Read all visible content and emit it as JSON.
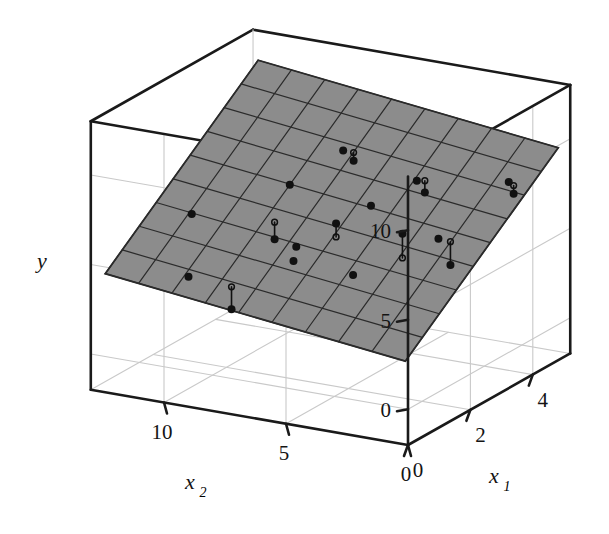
{
  "figure": {
    "kind": "3d-scatter-with-regression-plane",
    "background": "#ffffff",
    "width": 609,
    "height": 534
  },
  "axes": {
    "y": {
      "title": "y",
      "ticks": [
        "0",
        "5",
        "10"
      ],
      "tick_values": [
        0,
        5,
        10
      ],
      "range": [
        -2,
        13
      ]
    },
    "x1": {
      "title": "x",
      "subscript": "1",
      "ticks": [
        "0",
        "2",
        "4"
      ],
      "tick_values": [
        0,
        2,
        4
      ],
      "range": [
        0,
        5.2
      ]
    },
    "x2": {
      "title": "x",
      "subscript": "2",
      "ticks": [
        "0",
        "5",
        "10"
      ],
      "tick_values": [
        0,
        5,
        10
      ],
      "range": [
        0,
        13
      ]
    }
  },
  "style": {
    "axis_color": "#1a1a1a",
    "grid_color": "#c9c9c9",
    "plane_fill": "#8c8c8c",
    "plane_grid": "#2b2b2b",
    "point_color": "#111111",
    "stem_color": "#111111",
    "axis_width": 2.6,
    "grid_width": 1.1,
    "plane_grid_width": 1.2,
    "point_radius": 4.0
  },
  "chart_data": {
    "type": "scatter",
    "title": "",
    "xlabel": "x_1",
    "ylabel": "x_2",
    "zlabel": "y",
    "grid": true,
    "legend": "none",
    "axis_ranges": {
      "x1": [
        0,
        5.2
      ],
      "x2": [
        0,
        13
      ],
      "y": [
        -2,
        13
      ]
    },
    "plane": {
      "description": "Least-squares fitted regression plane y = b0 + b1*x1 + b2*x2",
      "b0": 2.2,
      "b1": 1.45,
      "b2": 0.16,
      "grid_cells_x1": 9,
      "grid_cells_x2": 9,
      "x1_extent": [
        0.15,
        5.05
      ],
      "x2_extent": [
        0.3,
        12.6
      ]
    },
    "points": [
      {
        "x1": 0.55,
        "x2": 9.7,
        "y": 4.55,
        "fit": 4.55
      },
      {
        "x1": 0.6,
        "x2": 8.0,
        "y": 3.1,
        "fit": 4.35
      },
      {
        "x1": 1.1,
        "x2": 6.1,
        "y": 5.75,
        "fit": 5.75
      },
      {
        "x1": 1.75,
        "x2": 11.1,
        "y": 6.55,
        "fit": 6.55
      },
      {
        "x1": 2.05,
        "x2": 7.2,
        "y": 5.35,
        "fit": 5.35
      },
      {
        "x1": 2.15,
        "x2": 5.0,
        "y": 4.2,
        "fit": 4.2
      },
      {
        "x1": 2.45,
        "x2": 8.6,
        "y": 5.05,
        "fit": 6.0
      },
      {
        "x1": 2.7,
        "x2": 6.4,
        "y": 6.2,
        "fit": 5.45
      },
      {
        "x1": 2.95,
        "x2": 4.0,
        "y": 5.95,
        "fit": 4.6
      },
      {
        "x1": 3.25,
        "x2": 9.0,
        "y": 7.2,
        "fit": 7.2
      },
      {
        "x1": 3.35,
        "x2": 5.8,
        "y": 6.7,
        "fit": 6.7
      },
      {
        "x1": 3.4,
        "x2": 3.1,
        "y": 5.45,
        "fit": 5.45
      },
      {
        "x1": 3.55,
        "x2": 2.8,
        "y": 3.9,
        "fit": 5.2
      },
      {
        "x1": 4.1,
        "x2": 7.9,
        "y": 8.55,
        "fit": 8.55
      },
      {
        "x1": 4.2,
        "x2": 7.6,
        "y": 7.95,
        "fit": 8.4
      },
      {
        "x1": 4.35,
        "x2": 5.2,
        "y": 7.25,
        "fit": 7.25
      },
      {
        "x1": 4.45,
        "x2": 5.0,
        "y": 6.55,
        "fit": 7.2
      },
      {
        "x1": 4.95,
        "x2": 2.2,
        "y": 7.3,
        "fit": 7.3
      },
      {
        "x1": 4.95,
        "x2": 2.0,
        "y": 6.7,
        "fit": 7.15
      }
    ]
  }
}
